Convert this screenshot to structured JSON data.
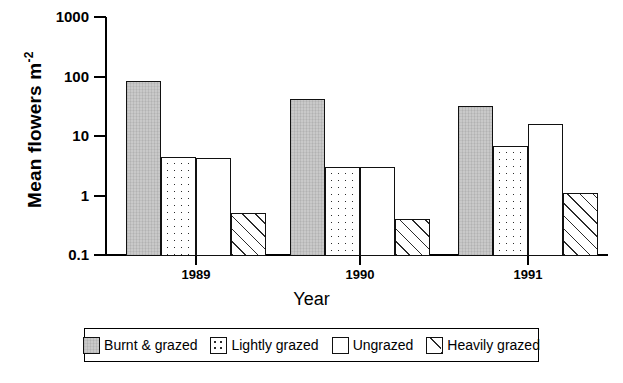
{
  "chart_data": {
    "type": "bar",
    "title": "",
    "xlabel": "Year",
    "ylabel": "Mean flowers m",
    "ylabel_exponent": "-2",
    "categories": [
      "1989",
      "1990",
      "1991"
    ],
    "yscale": "log",
    "ylim": [
      0.1,
      1000
    ],
    "yticks": [
      {
        "value": 1000,
        "label": "1000"
      },
      {
        "value": 100,
        "label": "100"
      },
      {
        "value": 10,
        "label": "10"
      },
      {
        "value": 1,
        "label": "1"
      },
      {
        "value": 0.1,
        "label": "0.1"
      }
    ],
    "grid": false,
    "legend_position": "bottom",
    "series": [
      {
        "name": "Burnt & grazed",
        "pattern": "solid-gray",
        "values": [
          85,
          42,
          32
        ]
      },
      {
        "name": "Lightly grazed",
        "pattern": "dotted",
        "values": [
          4.5,
          3.0,
          6.8
        ]
      },
      {
        "name": "Ungrazed",
        "pattern": "open",
        "values": [
          4.2,
          3.0,
          16
        ]
      },
      {
        "name": "Heavily grazed",
        "pattern": "hatched",
        "values": [
          0.5,
          0.4,
          1.1
        ]
      }
    ]
  },
  "axis": {
    "y_title_main": "Mean flowers m",
    "y_title_sup": "-2",
    "x_title": "Year"
  },
  "legend": {
    "items": [
      {
        "label": "Burnt & grazed"
      },
      {
        "label": "Lightly grazed"
      },
      {
        "label": "Ungrazed"
      },
      {
        "label": "Heavily grazed"
      }
    ]
  }
}
